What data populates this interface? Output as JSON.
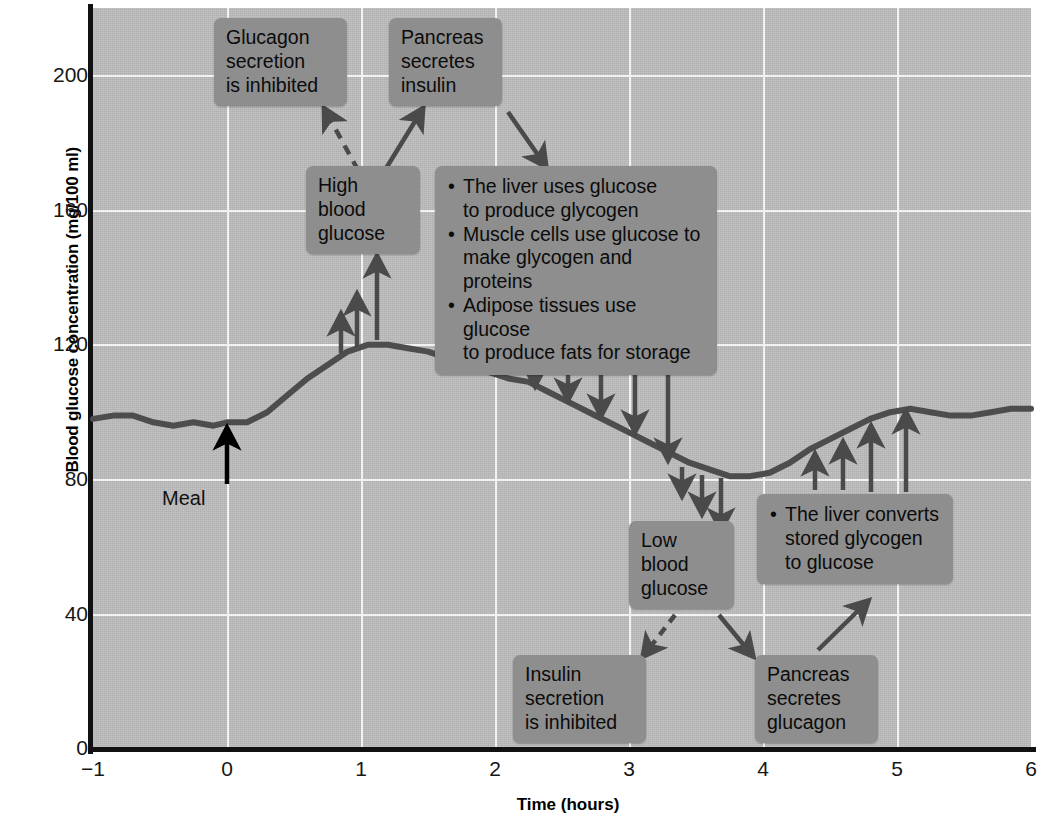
{
  "chart_data": {
    "type": "line",
    "title": "",
    "xlabel": "Time (hours)",
    "ylabel": "Blood glucose concentration\n(mg/100 ml)",
    "xlim": [
      -1,
      6
    ],
    "ylim": [
      0,
      220
    ],
    "xticks": [
      -1,
      0,
      1,
      2,
      3,
      4,
      5,
      6
    ],
    "xtick_labels": [
      "−1",
      "0",
      "1",
      "2",
      "3",
      "4",
      "5",
      "6"
    ],
    "yticks": [
      0,
      40,
      80,
      120,
      160,
      200
    ],
    "ytick_labels": [
      "0",
      "40",
      "80",
      "120",
      "160",
      "200"
    ],
    "grid": true,
    "grid_color": "#f2f2f2",
    "plot_bg": "#bdbdbd",
    "line_color": "#4d4d4d",
    "series": [
      {
        "name": "Blood glucose",
        "x": [
          -1.0,
          -0.85,
          -0.7,
          -0.55,
          -0.4,
          -0.25,
          -0.1,
          0.0,
          0.15,
          0.3,
          0.45,
          0.6,
          0.75,
          0.9,
          1.05,
          1.2,
          1.35,
          1.5,
          1.65,
          1.8,
          1.95,
          2.1,
          2.25,
          2.4,
          2.55,
          2.7,
          2.85,
          3.0,
          3.15,
          3.3,
          3.45,
          3.6,
          3.75,
          3.9,
          4.05,
          4.2,
          4.35,
          4.5,
          4.65,
          4.8,
          4.95,
          5.1,
          5.25,
          5.4,
          5.55,
          5.7,
          5.85,
          6.0
        ],
        "y": [
          98,
          99,
          99,
          97,
          96,
          97,
          96,
          97,
          97,
          100,
          105,
          110,
          114,
          118,
          120,
          120,
          119,
          118,
          116,
          114,
          112,
          110,
          109,
          106,
          103,
          100,
          97,
          94,
          91,
          88,
          85,
          83,
          81,
          81,
          82,
          85,
          89,
          92,
          95,
          98,
          100,
          101,
          100,
          99,
          99,
          100,
          101,
          101
        ]
      }
    ],
    "annotations": {
      "meal": {
        "label": "Meal",
        "x": 0.13,
        "y_tail": 83,
        "y_head": 96
      }
    }
  },
  "callouts": [
    {
      "id": "glucagon-inhibited",
      "text": "Glucagon\nsecretion\nis inhibited"
    },
    {
      "id": "pancreas-insulin",
      "text": "Pancreas\nsecretes\ninsulin"
    },
    {
      "id": "high-blood-glucose",
      "text": "High\nblood\nglucose"
    },
    {
      "id": "low-blood-glucose",
      "text": "Low\nblood\nglucose"
    },
    {
      "id": "insulin-inhibited",
      "text": "Insulin\nsecretion\nis inhibited"
    },
    {
      "id": "pancreas-glucagon",
      "text": "Pancreas\nsecretes\nglucagon"
    }
  ],
  "insulin_effects": {
    "bullet": "•",
    "items": [
      "The liver uses glucose\nto produce glycogen",
      "Muscle cells use glucose to\nmake glycogen and proteins",
      "Adipose tissues use glucose\nto produce fats for storage"
    ]
  },
  "glucagon_effects": {
    "bullet": "•",
    "items": [
      "The liver converts\nstored glycogen\nto glucose"
    ]
  },
  "colors": {
    "plot_background": "#bdbdbd",
    "callout_background": "#8e8e8e",
    "grid": "#f2f2f2",
    "curve": "#4d4d4d",
    "arrow": "#4a4a4a",
    "meal_arrow": "#000000",
    "axis": "#111111"
  }
}
